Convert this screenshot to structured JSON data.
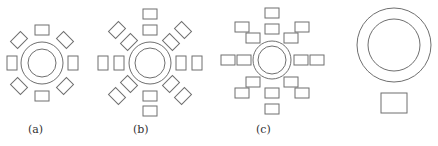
{
  "figures": [
    {
      "id": "a",
      "label": "(a)",
      "label_x": 28,
      "label_y": 123,
      "center": [
        42,
        63
      ],
      "outer_r": 21,
      "inner_r": 14,
      "arrangement": "single ring of 8 chairs"
    },
    {
      "id": "b",
      "label": "(b)",
      "label_x": 133,
      "label_y": 123,
      "center": [
        150,
        63
      ],
      "outer_r": 21,
      "inner_r": 15,
      "arrangement": "double ring of 16 chairs (radial)"
    },
    {
      "id": "c",
      "label": "(c)",
      "label_x": 256,
      "label_y": 123,
      "center": [
        272,
        60
      ],
      "outer_r": 19,
      "inner_r": 14,
      "arrangement": "double ring of 16 chairs (axis-aligned)"
    },
    {
      "id": "d",
      "label": "",
      "center": [
        394,
        45
      ],
      "outer_r": 37,
      "inner_r": 26,
      "arrangement": "single table with one chair below"
    }
  ],
  "colors": {
    "stroke": "#6f6f6f",
    "background": "#ffffff",
    "text": "#333333"
  }
}
